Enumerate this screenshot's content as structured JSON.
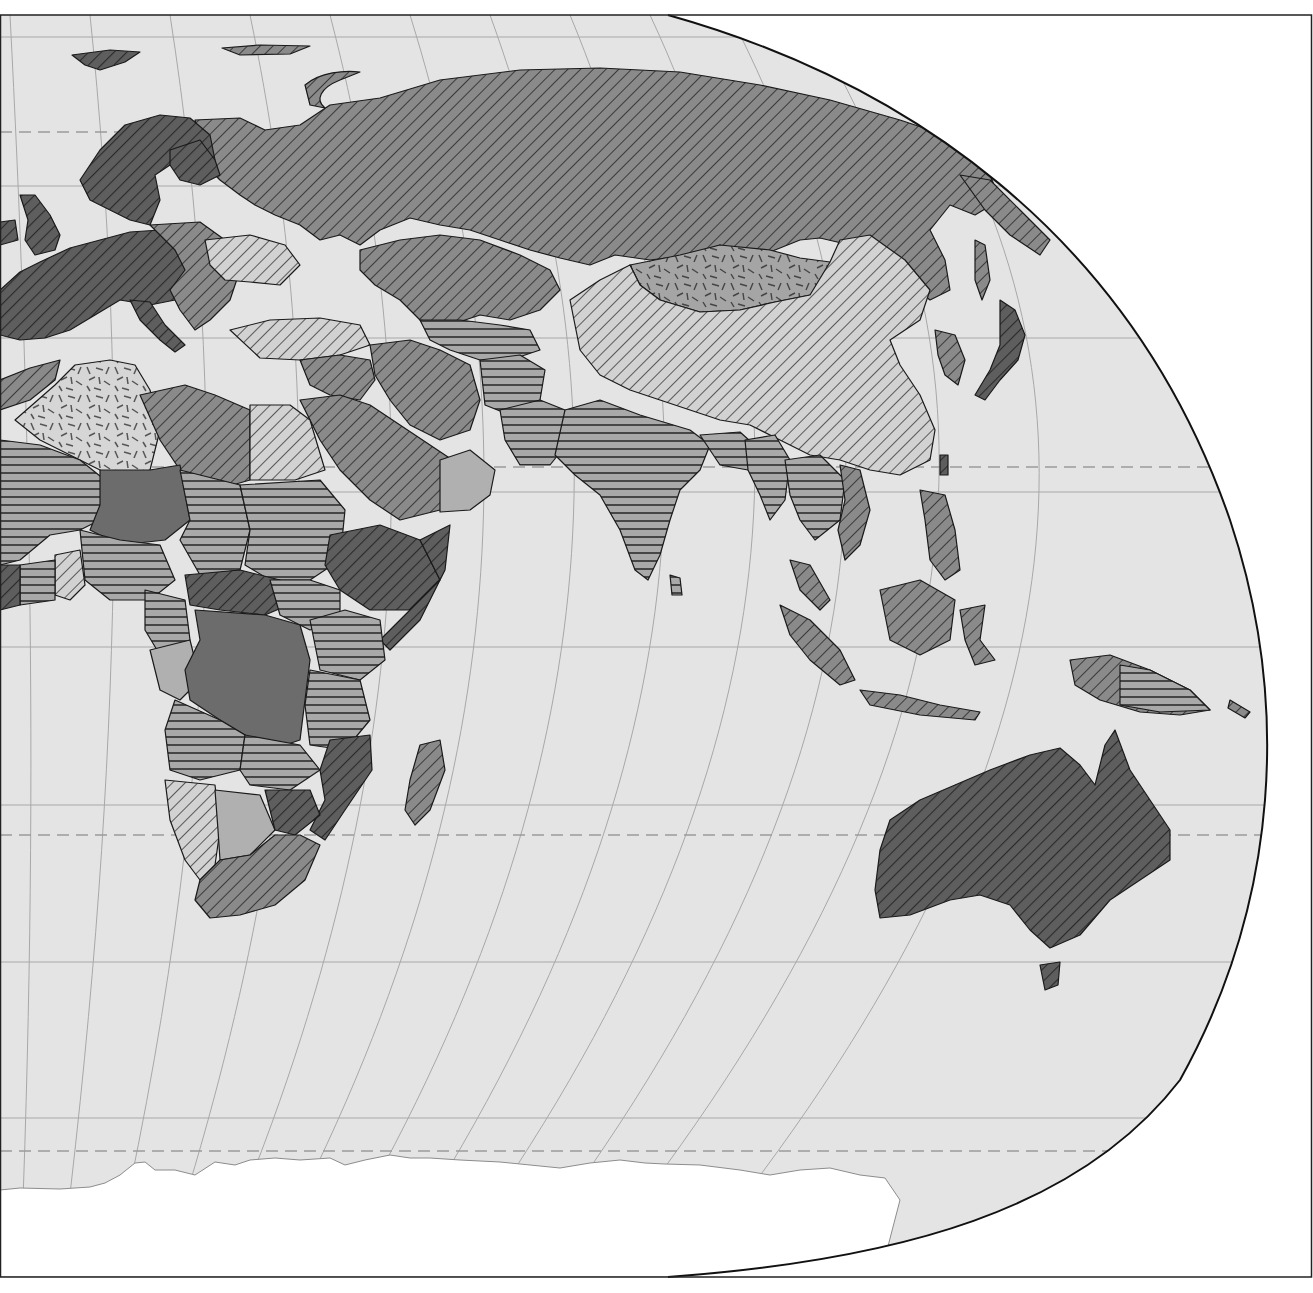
{
  "map": {
    "type": "choropleth",
    "projection": "pseudo-cylindrical (Robinson-like), eastern hemisphere crop",
    "rendering": "grayscale hatch-pattern fills",
    "colors": {
      "ocean": "#e4e4e4",
      "outside": "#ffffff",
      "graticule": "#a8a8a8",
      "tropic_dash": "#9a9a9a",
      "border": "#1a1a1a",
      "frame": "#111111",
      "antarctica": "#ffffff"
    },
    "fill_classes": [
      {
        "id": "c1",
        "fill": "#5e5e5e",
        "hatch": "diagonal-dense",
        "hatch_color": "#2a2a2a",
        "example_regions": [
          "Australia",
          "Europe (west)",
          "Scandinavia",
          "Somalia/Ethiopia"
        ]
      },
      {
        "id": "c2",
        "fill": "#8a8a8a",
        "hatch": "diagonal",
        "hatch_color": "#333333",
        "example_regions": [
          "Russia",
          "Kazakhstan",
          "Middle East",
          "Libya",
          "Southern Africa"
        ]
      },
      {
        "id": "c3",
        "fill": "#cfcfcf",
        "hatch": "diagonal-light",
        "hatch_color": "#333333",
        "example_regions": [
          "China",
          "Ukraine",
          "Egypt",
          "Namibia"
        ]
      },
      {
        "id": "c4",
        "fill": "#a5a5a5",
        "hatch": "horizontal",
        "hatch_color": "#3a3a3a",
        "example_regions": [
          "India",
          "Sahel",
          "Sudan",
          "Zambia"
        ]
      },
      {
        "id": "c5",
        "fill": "#d6d6d6",
        "hatch": "dashes-random",
        "hatch_color": "#555555",
        "example_regions": [
          "Algeria",
          "Mongolia"
        ]
      },
      {
        "id": "c6",
        "fill": "#6c6c6c",
        "hatch": "none",
        "hatch_color": "",
        "example_regions": [
          "Niger",
          "DR Congo"
        ]
      },
      {
        "id": "c7",
        "fill": "#b0b0b0",
        "hatch": "none",
        "hatch_color": "",
        "example_regions": [
          "Botswana",
          "Yemen",
          "Gabon"
        ]
      }
    ],
    "graticule": {
      "parallels_solid_y": [
        37,
        186,
        338,
        492,
        647,
        805,
        962,
        1118
      ],
      "parallels_dashed_y": [
        132,
        467,
        835,
        1151
      ],
      "parallels_dashed_meaning": [
        "Arctic Circle",
        "Tropic of Cancer",
        "Tropic of Capricorn",
        "Antarctic Circle"
      ]
    },
    "frame": {
      "x": 0,
      "y": 15,
      "width": 1313,
      "height": 1262
    }
  }
}
